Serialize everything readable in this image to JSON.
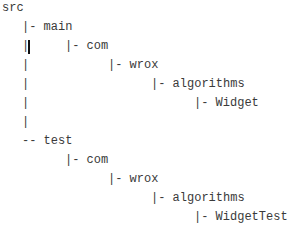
{
  "tree": {
    "root": "src",
    "main": {
      "label": "|- main",
      "com": "|- com",
      "wrox": "|- wrox",
      "algorithms": "|- algorithms",
      "leaf": "|- Widget"
    },
    "test": {
      "label": "-- test",
      "com": "|- com",
      "wrox": "|- wrox",
      "algorithms": "|- algorithms",
      "leaf": "|- WidgetTest"
    },
    "pipe": "|"
  }
}
